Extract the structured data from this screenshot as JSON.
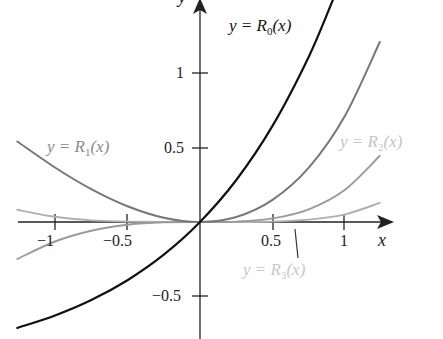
{
  "chart_data": {
    "type": "line",
    "title": "",
    "xlabel": "x",
    "ylabel": "y",
    "xlim": [
      -1.26,
      1.3
    ],
    "ylim": [
      -0.72,
      1.5
    ],
    "grid": false,
    "x_ticks": [
      {
        "value": -1,
        "label": "−1"
      },
      {
        "value": -0.5,
        "label": "−0.5"
      },
      {
        "value": 0.5,
        "label": "0.5"
      },
      {
        "value": 1,
        "label": "1"
      }
    ],
    "y_ticks": [
      {
        "value": 1,
        "label": "1"
      },
      {
        "value": 0.5,
        "label": "0.5"
      },
      {
        "value": -0.5,
        "label": "−0.5"
      }
    ],
    "series": [
      {
        "name": "R0",
        "label_prefix": "y = ",
        "label_func": "R",
        "label_sub": "0",
        "label_suffix": "(x)",
        "color": "#111111",
        "label_color": "#111111",
        "width": 2.2,
        "x": [
          -1.26,
          -1.0,
          -0.75,
          -0.5,
          -0.25,
          0.0,
          0.25,
          0.5,
          0.75,
          0.92
        ],
        "y": [
          -0.716,
          -0.632,
          -0.528,
          -0.393,
          -0.221,
          0.0,
          0.284,
          0.649,
          1.117,
          1.509
        ]
      },
      {
        "name": "R1",
        "label_prefix": "y = ",
        "label_func": "R",
        "label_sub": "1",
        "label_suffix": "(x)",
        "color": "#777777",
        "label_color": "#8a8a8a",
        "width": 2.0,
        "x": [
          -1.26,
          -1.0,
          -0.75,
          -0.5,
          -0.25,
          0.0,
          0.25,
          0.5,
          0.75,
          1.0,
          1.24
        ],
        "y": [
          0.544,
          0.368,
          0.222,
          0.107,
          0.029,
          0.0,
          0.034,
          0.149,
          0.367,
          0.718,
          1.216
        ]
      },
      {
        "name": "R2",
        "label_prefix": "y = ",
        "label_func": "R",
        "label_sub": "2",
        "label_suffix": "(x)",
        "color": "#9a9a9a",
        "label_color": "#c4c4c4",
        "width": 1.9,
        "x": [
          -1.26,
          -1.0,
          -0.75,
          -0.5,
          -0.25,
          0.0,
          0.25,
          0.5,
          0.75,
          1.0,
          1.24
        ],
        "y": [
          -0.25,
          -0.132,
          -0.059,
          -0.018,
          -0.002,
          0.0,
          0.003,
          0.024,
          0.086,
          0.218,
          0.447
        ]
      },
      {
        "name": "R3",
        "label_prefix": "y = ",
        "label_func": "R",
        "label_sub": "3",
        "label_suffix": "(x)",
        "color": "#b0b0b0",
        "label_color": "#c8c8c8",
        "width": 1.9,
        "x": [
          -1.26,
          -1.0,
          -0.75,
          -0.5,
          -0.25,
          0.0,
          0.25,
          0.5,
          0.75,
          1.0,
          1.24
        ],
        "y": [
          0.083,
          0.035,
          0.011,
          0.003,
          0.0,
          0.0,
          0.0,
          0.003,
          0.016,
          0.052,
          0.129
        ]
      }
    ],
    "annotations": [
      {
        "text": "y = R0(x)",
        "series": "R0"
      },
      {
        "text": "y = R1(x)",
        "series": "R1"
      },
      {
        "text": "y = R2(x)",
        "series": "R2"
      },
      {
        "text": "y = R3(x)",
        "series": "R3",
        "leader_line": true
      }
    ]
  },
  "labels": {
    "r0": {
      "prefix": "y = ",
      "func": "R",
      "sub": "0",
      "suffix": "(x)"
    },
    "r1": {
      "prefix": "y = ",
      "func": "R",
      "sub": "1",
      "suffix": "(x)"
    },
    "r2": {
      "prefix": "y = ",
      "func": "R",
      "sub": "2",
      "suffix": "(x)"
    },
    "r3": {
      "prefix": "y = ",
      "func": "R",
      "sub": "3",
      "suffix": "(x)"
    }
  },
  "axes": {
    "x_name": "x",
    "y_name": "y",
    "x_ticks": {
      "neg1": "−1",
      "neg05": "−0.5",
      "pos05": "0.5",
      "pos1": "1"
    },
    "y_ticks": {
      "pos1": "1",
      "pos05": "0.5",
      "neg05": "−0.5"
    }
  }
}
